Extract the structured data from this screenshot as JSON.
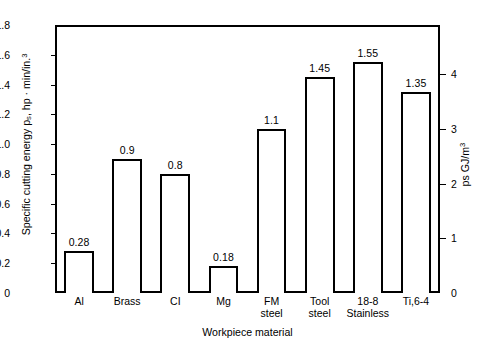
{
  "chart_data": {
    "type": "bar",
    "title": "",
    "xlabel": "Workpiece material",
    "ylabel": "Specific cutting energy ps, hp · min/in.3",
    "ylabel_right": "ps GJ/m3",
    "categories": [
      "Al",
      "Brass",
      "CI",
      "Mg",
      "FM steel",
      "Tool steel",
      "18-8 Stainless",
      "Ti,6-4"
    ],
    "category_lines": [
      {
        "line1": "Al",
        "line2": ""
      },
      {
        "line1": "Brass",
        "line2": ""
      },
      {
        "line1": "CI",
        "line2": ""
      },
      {
        "line1": "Mg",
        "line2": ""
      },
      {
        "line1": "FM",
        "line2": "steel"
      },
      {
        "line1": "Tool",
        "line2": "steel"
      },
      {
        "line1": "18-8",
        "line2": "Stainless"
      },
      {
        "line1": "Ti,6-4",
        "line2": ""
      }
    ],
    "values": [
      0.28,
      0.9,
      0.8,
      0.18,
      1.1,
      1.45,
      1.55,
      1.35
    ],
    "value_labels": [
      "0.28",
      "0.9",
      "0.8",
      "0.18",
      "1.1",
      "1.45",
      "1.55",
      "1.35"
    ],
    "ylim": [
      0,
      1.8
    ],
    "yticks": [
      0,
      0.2,
      0.4,
      0.6,
      0.8,
      1.0,
      1.2,
      1.4,
      1.6,
      1.8
    ],
    "ytick_labels": [
      "0",
      "0.2",
      "0.4",
      "0.6",
      "0.8",
      "1.0",
      "1.2",
      "1.4",
      "1.6",
      "1.8"
    ],
    "ylim_right": [
      0,
      4.9
    ],
    "yticks_right": [
      0,
      1,
      2,
      3,
      4
    ],
    "ytick_labels_right": [
      "0",
      "1",
      "2",
      "3",
      "4"
    ],
    "grid": false,
    "legend": "none",
    "bar_fill": "#ffffff",
    "bar_edge": "#000000",
    "background": "#ffffff"
  }
}
